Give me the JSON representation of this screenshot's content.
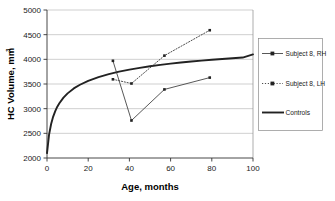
{
  "chart_data": {
    "type": "line",
    "title": "",
    "subtitle": "",
    "xlabel": "Age, months",
    "ylabel": "HC Volume, mm",
    "ylabel_superscript": "3",
    "xlim": [
      0,
      100
    ],
    "ylim": [
      2000,
      5000
    ],
    "xticks": [
      0,
      20,
      40,
      60,
      80,
      100
    ],
    "yticks": [
      2000,
      2500,
      3000,
      3500,
      4000,
      4500,
      5000
    ],
    "xticklabels": [
      "0",
      "20",
      "40",
      "60",
      "80",
      "100"
    ],
    "yticklabels": [
      "2000",
      "2500",
      "3000",
      "3500",
      "4000",
      "4500",
      "5000"
    ],
    "grid": "horizontal",
    "legend_position": "right-outside",
    "series": [
      {
        "name": "Subject 8, RH",
        "style": "solid-with-markers",
        "marker": "square",
        "color": "#222222",
        "x": [
          32,
          41,
          57,
          79
        ],
        "y": [
          3970,
          2760,
          3390,
          3630
        ]
      },
      {
        "name": "Subject 8, LH",
        "style": "dotted-with-markers",
        "marker": "square",
        "color": "#222222",
        "x": [
          32,
          41,
          57,
          79
        ],
        "y": [
          3595,
          3510,
          4075,
          4590
        ]
      },
      {
        "name": "Controls",
        "style": "thick-solid",
        "marker": "none",
        "color": "#222222",
        "x": [
          0,
          1,
          2,
          3,
          4,
          5,
          6,
          8,
          10,
          13,
          16,
          20,
          25,
          30,
          35,
          40,
          45,
          50,
          55,
          60,
          65,
          70,
          75,
          80,
          85,
          90,
          95,
          100
        ],
        "y": [
          2100,
          2475,
          2690,
          2840,
          2950,
          3040,
          3110,
          3225,
          3310,
          3410,
          3485,
          3565,
          3640,
          3700,
          3750,
          3792,
          3828,
          3860,
          3888,
          3913,
          3935,
          3955,
          3974,
          3991,
          4007,
          4022,
          4036,
          4100
        ]
      }
    ]
  },
  "legend": {
    "entries": [
      {
        "label": "Subject 8, RH"
      },
      {
        "label": "Subject 8, LH"
      },
      {
        "label": "Controls"
      }
    ]
  },
  "caption": {
    "text": ""
  }
}
